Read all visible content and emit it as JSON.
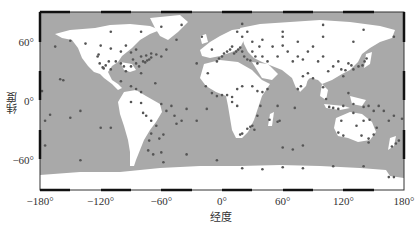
{
  "map": {
    "type": "world-station-map",
    "projection": "equirectangular",
    "xlabel": "经度",
    "ylabel": "纬度",
    "x_ticks": [
      "−180°",
      "−120°",
      "−60°",
      "0°",
      "60°",
      "120°",
      "180°"
    ],
    "x_tick_values": [
      -180,
      -120,
      -60,
      0,
      60,
      120,
      180
    ],
    "y_ticks": [
      "60°",
      "0°",
      "−60°"
    ],
    "y_tick_values": [
      60,
      0,
      -60
    ],
    "colors": {
      "ocean": "#a9a9a9",
      "land": "#ffffff",
      "station": "#555555",
      "frame": "#222222"
    },
    "stations": [
      [
        -150,
        61
      ],
      [
        -135,
        58
      ],
      [
        -120,
        56
      ],
      [
        -110,
        53
      ],
      [
        -100,
        50
      ],
      [
        -95,
        56
      ],
      [
        -90,
        49
      ],
      [
        -85,
        52
      ],
      [
        -80,
        45
      ],
      [
        -75,
        46
      ],
      [
        -70,
        48
      ],
      [
        -65,
        47
      ],
      [
        -122,
        47
      ],
      [
        -123,
        45
      ],
      [
        -121,
        38
      ],
      [
        -118,
        34
      ],
      [
        -117,
        33
      ],
      [
        -115,
        36
      ],
      [
        -112,
        40
      ],
      [
        -110,
        32
      ],
      [
        -105,
        40
      ],
      [
        -100,
        38
      ],
      [
        -97,
        35
      ],
      [
        -95,
        30
      ],
      [
        -90,
        35
      ],
      [
        -88,
        42
      ],
      [
        -85,
        38
      ],
      [
        -82,
        35
      ],
      [
        -80,
        28
      ],
      [
        -78,
        40
      ],
      [
        -76,
        39
      ],
      [
        -74,
        41
      ],
      [
        -72,
        42
      ],
      [
        -70,
        44
      ],
      [
        -66,
        18
      ],
      [
        -100,
        20
      ],
      [
        -90,
        15
      ],
      [
        -85,
        12
      ],
      [
        -80,
        9
      ],
      [
        -60,
        45
      ],
      [
        -45,
        62
      ],
      [
        -20,
        65
      ],
      [
        -55,
        52
      ],
      [
        -160,
        22
      ],
      [
        -157,
        21
      ],
      [
        -150,
        -17
      ],
      [
        -140,
        -10
      ],
      [
        -170,
        -14
      ],
      [
        -175,
        -20
      ],
      [
        -120,
        -27
      ],
      [
        -110,
        -27
      ],
      [
        -90,
        -1
      ],
      [
        -80,
        -2
      ],
      [
        -78,
        -12
      ],
      [
        -75,
        -15
      ],
      [
        -70,
        -20
      ],
      [
        -70,
        -33
      ],
      [
        -72,
        -40
      ],
      [
        -73,
        -50
      ],
      [
        -68,
        -54
      ],
      [
        -60,
        -3
      ],
      [
        -55,
        -10
      ],
      [
        -50,
        -5
      ],
      [
        -47,
        -15
      ],
      [
        -45,
        -23
      ],
      [
        -40,
        -20
      ],
      [
        -35,
        -8
      ],
      [
        -58,
        -34
      ],
      [
        -62,
        -38
      ],
      [
        -65,
        -25
      ],
      [
        -60,
        -52
      ],
      [
        -58,
        -62
      ],
      [
        -15,
        -8
      ],
      [
        -25,
        -20
      ],
      [
        -14,
        28
      ],
      [
        -16,
        15
      ],
      [
        -10,
        8
      ],
      [
        -5,
        5
      ],
      [
        0,
        6
      ],
      [
        5,
        6
      ],
      [
        10,
        4
      ],
      [
        15,
        12
      ],
      [
        20,
        15
      ],
      [
        30,
        15
      ],
      [
        35,
        10
      ],
      [
        40,
        9
      ],
      [
        45,
        12
      ],
      [
        38,
        -5
      ],
      [
        35,
        -15
      ],
      [
        30,
        -25
      ],
      [
        28,
        -26
      ],
      [
        25,
        -28
      ],
      [
        20,
        -33
      ],
      [
        18,
        -34
      ],
      [
        32,
        -29
      ],
      [
        15,
        -5
      ],
      [
        10,
        -1
      ],
      [
        47,
        -19
      ],
      [
        55,
        -21
      ],
      [
        57,
        -20
      ],
      [
        -5,
        40
      ],
      [
        -3,
        43
      ],
      [
        0,
        45
      ],
      [
        2,
        48
      ],
      [
        5,
        50
      ],
      [
        8,
        52
      ],
      [
        10,
        55
      ],
      [
        12,
        48
      ],
      [
        14,
        50
      ],
      [
        16,
        52
      ],
      [
        18,
        54
      ],
      [
        20,
        50
      ],
      [
        22,
        45
      ],
      [
        25,
        42
      ],
      [
        28,
        41
      ],
      [
        30,
        50
      ],
      [
        33,
        45
      ],
      [
        35,
        38
      ],
      [
        37,
        55
      ],
      [
        40,
        45
      ],
      [
        45,
        40
      ],
      [
        50,
        55
      ],
      [
        55,
        45
      ],
      [
        60,
        56
      ],
      [
        65,
        50
      ],
      [
        70,
        40
      ],
      [
        75,
        45
      ],
      [
        80,
        42
      ],
      [
        85,
        50
      ],
      [
        90,
        55
      ],
      [
        95,
        40
      ],
      [
        100,
        45
      ],
      [
        105,
        30
      ],
      [
        110,
        35
      ],
      [
        115,
        40
      ],
      [
        118,
        32
      ],
      [
        120,
        25
      ],
      [
        122,
        31
      ],
      [
        125,
        38
      ],
      [
        128,
        36
      ],
      [
        130,
        32
      ],
      [
        135,
        35
      ],
      [
        139,
        36
      ],
      [
        141,
        40
      ],
      [
        143,
        43
      ],
      [
        130,
        60
      ],
      [
        100,
        65
      ],
      [
        75,
        60
      ],
      [
        60,
        65
      ],
      [
        30,
        60
      ],
      [
        20,
        65
      ],
      [
        15,
        70
      ],
      [
        25,
        70
      ],
      [
        40,
        62
      ],
      [
        80,
        25
      ],
      [
        78,
        15
      ],
      [
        75,
        12
      ],
      [
        85,
        28
      ],
      [
        90,
        23
      ],
      [
        100,
        14
      ],
      [
        103,
        2
      ],
      [
        106,
        -6
      ],
      [
        110,
        -7
      ],
      [
        115,
        -8
      ],
      [
        120,
        -5
      ],
      [
        125,
        8
      ],
      [
        130,
        -3
      ],
      [
        140,
        -6
      ],
      [
        145,
        -5
      ],
      [
        150,
        -10
      ],
      [
        155,
        -5
      ],
      [
        160,
        -10
      ],
      [
        165,
        -20
      ],
      [
        170,
        -15
      ],
      [
        178,
        -18
      ],
      [
        175,
        -40
      ],
      [
        172,
        -43
      ],
      [
        168,
        -46
      ],
      [
        115,
        -32
      ],
      [
        118,
        -20
      ],
      [
        130,
        -12
      ],
      [
        133,
        -25
      ],
      [
        138,
        -35
      ],
      [
        145,
        -38
      ],
      [
        150,
        -34
      ],
      [
        153,
        -27
      ],
      [
        146,
        -19
      ],
      [
        145,
        -42
      ],
      [
        120,
        -35
      ],
      [
        140,
        -20
      ],
      [
        72,
        -7
      ],
      [
        55,
        -5
      ],
      [
        60,
        -47
      ],
      [
        70,
        -49
      ],
      [
        80,
        -45
      ],
      [
        -5,
        -60
      ],
      [
        20,
        -68
      ],
      [
        40,
        -69
      ],
      [
        60,
        -67
      ],
      [
        80,
        -68
      ],
      [
        110,
        -66
      ],
      [
        140,
        -66
      ],
      [
        165,
        -77
      ],
      [
        170,
        -77
      ],
      [
        -140,
        -60
      ],
      [
        -175,
        -45
      ],
      [
        -178,
        10
      ],
      [
        -165,
        55
      ],
      [
        -110,
        70
      ],
      [
        -80,
        70
      ],
      [
        -60,
        75
      ],
      [
        -40,
        77
      ],
      [
        20,
        78
      ],
      [
        60,
        70
      ],
      [
        100,
        77
      ],
      [
        140,
        72
      ],
      [
        170,
        65
      ],
      [
        -10,
        52
      ],
      [
        -25,
        38
      ],
      [
        -35,
        -54
      ]
    ]
  }
}
